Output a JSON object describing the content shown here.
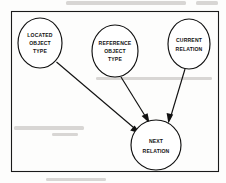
{
  "figure": {
    "kind": "node-link-diagram",
    "background_color": "#fdfdfc",
    "ink_color": "#111111",
    "frame": {
      "label": "diagram-border",
      "x": 11,
      "y": 11,
      "width": 208,
      "height": 161
    }
  },
  "nodes": [
    {
      "id": "located-object-type",
      "shape": "ellipse",
      "cx": 40,
      "cy": 43,
      "rx": 22,
      "ry": 25,
      "lines": [
        "LOCATED",
        "OBJECT",
        "TYPE"
      ]
    },
    {
      "id": "reference-object-type",
      "shape": "ellipse",
      "cx": 115,
      "cy": 51,
      "rx": 23,
      "ry": 26,
      "lines": [
        "REFERENCE",
        "OBJECT",
        "TYPE"
      ]
    },
    {
      "id": "current-relation",
      "shape": "ellipse",
      "cx": 189,
      "cy": 44,
      "rx": 21,
      "ry": 25,
      "lines": [
        "CURRENT",
        "RELATION"
      ]
    },
    {
      "id": "next-relation",
      "shape": "ellipse",
      "cx": 156,
      "cy": 145,
      "rx": 25,
      "ry": 25,
      "lines": [
        "NEXT",
        "RELATION"
      ]
    }
  ],
  "edges": [
    {
      "id": "located-to-next",
      "from": "located-object-type",
      "to": "next-relation",
      "style": "solid-arrow",
      "direction": "down-right"
    },
    {
      "id": "reference-to-next",
      "from": "reference-object-type",
      "to": "next-relation",
      "style": "solid-arrow",
      "direction": "down-right"
    },
    {
      "id": "current-to-next",
      "from": "current-relation",
      "to": "next-relation",
      "style": "solid-arrow",
      "direction": "down-left"
    }
  ],
  "scan_artifacts": {
    "description": "faint grey bleed-through of page text behind the figure",
    "top_smudge_text": "",
    "left_smudge_text": ""
  }
}
